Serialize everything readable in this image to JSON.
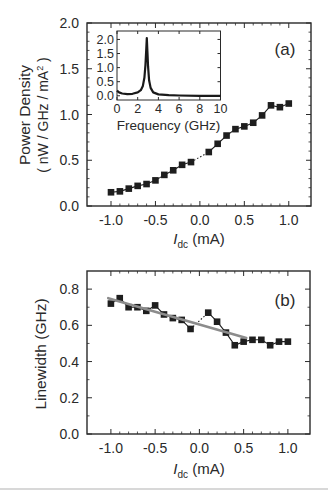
{
  "chart_data": [
    {
      "id": "a",
      "type": "line",
      "panel_label": "(a)",
      "title": "",
      "xlabel": "I_dc (mA)",
      "xlabel_main": "I",
      "xlabel_sub": "dc",
      "xlabel_unit": " (mA)",
      "ylabel": "Power Density",
      "ylabel_line2": "( nW / GHz / mA",
      "ylabel_sup": "2",
      "ylabel_line2_end": " )",
      "xlim": [
        -1.27,
        1.25
      ],
      "ylim": [
        0.0,
        2.0
      ],
      "xticks": [
        -1.0,
        -0.5,
        0.0,
        0.5,
        1.0
      ],
      "xtick_labels": [
        "-1.0",
        "-0.5",
        "0.0",
        "0.5",
        "1.0"
      ],
      "yticks": [
        0.0,
        0.5,
        1.0,
        1.5,
        2.0
      ],
      "ytick_labels": [
        "0.0",
        "0.5",
        "1.0",
        "1.5",
        "2.0"
      ],
      "grid": false,
      "series": [
        {
          "name": "Power density (I < 0)",
          "marker": "square",
          "x": [
            -1.0,
            -0.9,
            -0.8,
            -0.7,
            -0.6,
            -0.5,
            -0.4,
            -0.3,
            -0.2,
            -0.1
          ],
          "values": [
            0.15,
            0.16,
            0.19,
            0.22,
            0.24,
            0.28,
            0.34,
            0.39,
            0.45,
            0.48
          ]
        },
        {
          "name": "Power density (I > 0)",
          "marker": "square",
          "x": [
            0.1,
            0.2,
            0.3,
            0.4,
            0.5,
            0.6,
            0.7,
            0.8,
            0.9,
            1.0
          ],
          "values": [
            0.59,
            0.68,
            0.77,
            0.84,
            0.87,
            0.91,
            0.99,
            1.1,
            1.08,
            1.12
          ]
        }
      ],
      "connector": {
        "style": "dotted",
        "from": [
          -0.1,
          0.48
        ],
        "to": [
          0.1,
          0.59
        ]
      },
      "inset": {
        "type": "line",
        "xlabel": "Frequency (GHz)",
        "ylabel": "",
        "xlim": [
          0,
          10
        ],
        "ylim": [
          -0.15,
          2.3
        ],
        "xticks": [
          0,
          2,
          4,
          6,
          8,
          10
        ],
        "xtick_labels": [
          "0",
          "2",
          "4",
          "6",
          "8",
          "10"
        ],
        "yticks": [
          0.0,
          0.5,
          1.0,
          1.5,
          2.0
        ],
        "ytick_labels": [
          "0.0",
          "0.5",
          "1.0",
          "1.5",
          "2.0"
        ],
        "series": [
          {
            "name": "Spectrum",
            "x": [
              0.0,
              0.2,
              0.5,
              1.0,
              1.5,
              2.0,
              2.3,
              2.5,
              2.65,
              2.75,
              2.82,
              2.88,
              2.94,
              3.0,
              3.1,
              3.25,
              3.5,
              4.0,
              5.0,
              6.0,
              8.0,
              10.0
            ],
            "values": [
              0.18,
              0.12,
              0.08,
              0.06,
              0.07,
              0.12,
              0.2,
              0.35,
              0.65,
              1.1,
              1.6,
              2.05,
              1.55,
              1.05,
              0.55,
              0.28,
              0.12,
              0.05,
              0.02,
              0.01,
              0.0,
              0.0
            ]
          }
        ]
      }
    },
    {
      "id": "b",
      "type": "line",
      "panel_label": "(b)",
      "title": "",
      "xlabel": "I_dc (mA)",
      "xlabel_main": "I",
      "xlabel_sub": "dc",
      "xlabel_unit": " (mA)",
      "ylabel": "Linewidth (GHz)",
      "xlim": [
        -1.27,
        1.25
      ],
      "ylim": [
        0.0,
        0.9
      ],
      "xticks": [
        -1.0,
        -0.5,
        0.0,
        0.5,
        1.0
      ],
      "xtick_labels": [
        "-1.0",
        "-0.5",
        "0.0",
        "0.5",
        "1.0"
      ],
      "yticks": [
        0.0,
        0.2,
        0.4,
        0.6,
        0.8
      ],
      "ytick_labels": [
        "0.0",
        "0.2",
        "0.4",
        "0.6",
        "0.8"
      ],
      "grid": false,
      "series": [
        {
          "name": "Linewidth (I < 0)",
          "marker": "square",
          "x": [
            -1.0,
            -0.9,
            -0.8,
            -0.7,
            -0.6,
            -0.5,
            -0.4,
            -0.3,
            -0.2,
            -0.1
          ],
          "values": [
            0.72,
            0.75,
            0.7,
            0.7,
            0.68,
            0.71,
            0.66,
            0.64,
            0.63,
            0.58
          ]
        },
        {
          "name": "Linewidth (I > 0)",
          "marker": "square",
          "x": [
            0.1,
            0.2,
            0.3,
            0.4,
            0.5,
            0.6,
            0.7,
            0.8,
            0.9,
            1.0
          ],
          "values": [
            0.67,
            0.62,
            0.56,
            0.49,
            0.51,
            0.52,
            0.52,
            0.49,
            0.51,
            0.51
          ]
        },
        {
          "name": "Linear fit",
          "style": "fit",
          "color": "#8c8c8c",
          "x": [
            -1.03,
            0.53
          ],
          "values": [
            0.75,
            0.53
          ]
        }
      ],
      "connector": {
        "style": "dotted",
        "from": [
          -0.1,
          0.58
        ],
        "to": [
          0.1,
          0.67
        ]
      }
    }
  ],
  "colors": {
    "axis": "#2a2a2a",
    "marker": "#1e1e1e",
    "fit": "#8c8c8c"
  }
}
